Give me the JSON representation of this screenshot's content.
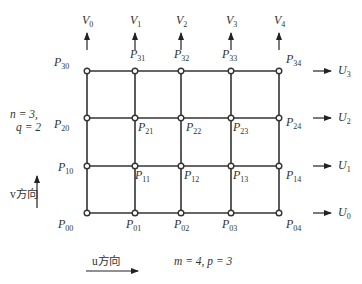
{
  "diagram": {
    "type": "control-point-grid",
    "grid": {
      "columns": 5,
      "rows": 4,
      "x": [
        87,
        135,
        181,
        231,
        279
      ],
      "y": [
        71,
        118,
        166,
        213
      ],
      "line_color": "#333333",
      "node_fill": "#ffffff"
    },
    "points": [
      {
        "label": "P",
        "sub": "30",
        "x": 58,
        "y": 63
      },
      {
        "label": "P",
        "sub": "31",
        "x": 134,
        "y": 55
      },
      {
        "label": "P",
        "sub": "32",
        "x": 178,
        "y": 55
      },
      {
        "label": "P",
        "sub": "33",
        "x": 226,
        "y": 55
      },
      {
        "label": "P",
        "sub": "34",
        "x": 290,
        "y": 60
      },
      {
        "label": "P",
        "sub": "20",
        "x": 58,
        "y": 125
      },
      {
        "label": "P",
        "sub": "21",
        "x": 142,
        "y": 128
      },
      {
        "label": "P",
        "sub": "22",
        "x": 190,
        "y": 128
      },
      {
        "label": "P",
        "sub": "23",
        "x": 237,
        "y": 128
      },
      {
        "label": "P",
        "sub": "24",
        "x": 290,
        "y": 123
      },
      {
        "label": "P",
        "sub": "10",
        "x": 62,
        "y": 168
      },
      {
        "label": "P",
        "sub": "11",
        "x": 139,
        "y": 176
      },
      {
        "label": "P",
        "sub": "12",
        "x": 188,
        "y": 176
      },
      {
        "label": "P",
        "sub": "13",
        "x": 237,
        "y": 176
      },
      {
        "label": "P",
        "sub": "14",
        "x": 290,
        "y": 176
      },
      {
        "label": "P",
        "sub": "00",
        "x": 62,
        "y": 225
      },
      {
        "label": "P",
        "sub": "01",
        "x": 130,
        "y": 225
      },
      {
        "label": "P",
        "sub": "02",
        "x": 178,
        "y": 225
      },
      {
        "label": "P",
        "sub": "03",
        "x": 226,
        "y": 225
      },
      {
        "label": "P",
        "sub": "04",
        "x": 290,
        "y": 225
      }
    ],
    "v_arrows": [
      {
        "label": "V",
        "sub": "0",
        "x": 87
      },
      {
        "label": "V",
        "sub": "1",
        "x": 135
      },
      {
        "label": "V",
        "sub": "2",
        "x": 181
      },
      {
        "label": "V",
        "sub": "3",
        "x": 231
      },
      {
        "label": "V",
        "sub": "4",
        "x": 279
      }
    ],
    "u_arrows": [
      {
        "label": "U",
        "sub": "3",
        "y": 71
      },
      {
        "label": "U",
        "sub": "2",
        "y": 118
      },
      {
        "label": "U",
        "sub": "1",
        "y": 166
      },
      {
        "label": "U",
        "sub": "0",
        "y": 213
      }
    ],
    "annotations": {
      "n_line": "n = 3,",
      "q_line": "q = 2",
      "v_direction": "v方向",
      "u_direction": "u方向",
      "m_p": "m = 4, p = 3"
    }
  }
}
